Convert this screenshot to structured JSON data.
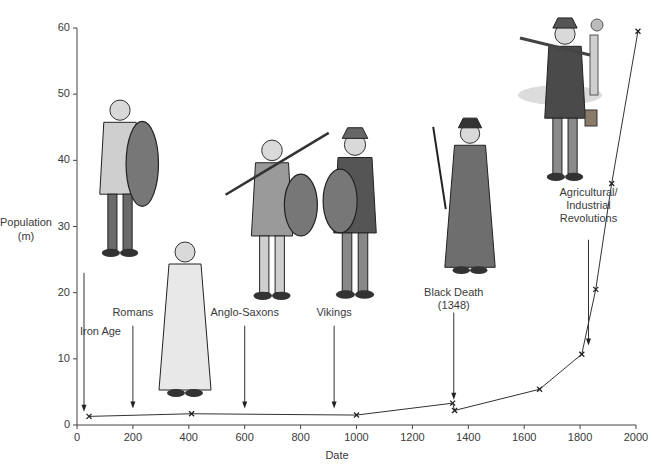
{
  "chart_data": {
    "type": "line",
    "title": "",
    "xlabel": "Date",
    "ylabel": "Population (m)",
    "ylabel_lines": [
      "Population",
      "(m)"
    ],
    "xlim": [
      0,
      2000
    ],
    "ylim": [
      0,
      60
    ],
    "grid": false,
    "legend": null,
    "x_ticks": [
      0,
      200,
      400,
      600,
      800,
      1000,
      1200,
      1400,
      1600,
      1800,
      2000
    ],
    "y_ticks": [
      0,
      10,
      20,
      30,
      40,
      50,
      60
    ],
    "series": [
      {
        "name": "Population",
        "marker": "x",
        "x": [
          43,
          410,
          1000,
          1344,
          1351,
          1655,
          1806,
          1856,
          1913,
          2007
        ],
        "y": [
          1.3,
          1.7,
          1.5,
          3.3,
          2.2,
          5.4,
          10.7,
          20.5,
          36.5,
          59.5
        ]
      }
    ],
    "annotations": [
      {
        "text": "Iron Age",
        "lines": [
          "Iron Age"
        ],
        "x": 25,
        "arrow_from_y": 23,
        "arrow_to_y": 2,
        "label_y": 14
      },
      {
        "text": "Romans",
        "lines": [
          "Romans"
        ],
        "x": 200,
        "arrow_from_y": 15,
        "arrow_to_y": 2.5,
        "label_y": 17
      },
      {
        "text": "Anglo-Saxons",
        "lines": [
          "Anglo-Saxons"
        ],
        "x": 600,
        "arrow_from_y": 15,
        "arrow_to_y": 2.5,
        "label_y": 17
      },
      {
        "text": "Vikings",
        "lines": [
          "Vikings"
        ],
        "x": 920,
        "arrow_from_y": 15,
        "arrow_to_y": 2.5,
        "label_y": 17
      },
      {
        "text": "Black Death (1348)",
        "lines": [
          "Black Death",
          "(1348)"
        ],
        "x": 1348,
        "arrow_from_y": 17,
        "arrow_to_y": 3.8,
        "label_y": 20
      },
      {
        "text": "Agricultural/ Industrial Revolutions",
        "lines": [
          "Agricultural/",
          "Industrial",
          "Revolutions"
        ],
        "x": 1830,
        "arrow_from_y": 28,
        "arrow_to_y": 12,
        "label_y": 35
      }
    ],
    "illustrations": [
      {
        "name": "iron-age-warrior",
        "x_center": 220,
        "y_top": 50
      },
      {
        "name": "roman-citizen",
        "x_center": 470,
        "y_top": 30
      },
      {
        "name": "anglo-saxon-warrior",
        "x_center": 720,
        "y_top": 44
      },
      {
        "name": "viking-warrior",
        "x_center": 1000,
        "y_top": 44
      },
      {
        "name": "plague-doctor",
        "x_center": 1440,
        "y_top": 46
      },
      {
        "name": "industrial-worker",
        "x_center": 1720,
        "y_top": 61
      }
    ]
  }
}
